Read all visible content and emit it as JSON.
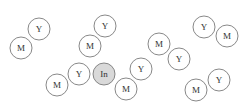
{
  "diagram": {
    "radius": 11,
    "colors": {
      "stroke": "#7a7a7a",
      "fill": "#ffffff",
      "center_fill": "#d9d9d9",
      "text": "#333333"
    },
    "nodes": [
      {
        "label": "Y",
        "x": 39,
        "y": 29,
        "type": "normal"
      },
      {
        "label": "M",
        "x": 21,
        "y": 48,
        "type": "normal"
      },
      {
        "label": "Y",
        "x": 105,
        "y": 26,
        "type": "normal"
      },
      {
        "label": "M",
        "x": 90,
        "y": 46,
        "type": "normal"
      },
      {
        "label": "M",
        "x": 57,
        "y": 85,
        "type": "normal"
      },
      {
        "label": "Y",
        "x": 79,
        "y": 74,
        "type": "normal"
      },
      {
        "label": "In",
        "x": 104,
        "y": 74,
        "type": "center"
      },
      {
        "label": "M",
        "x": 126,
        "y": 89,
        "type": "normal"
      },
      {
        "label": "Y",
        "x": 141,
        "y": 69,
        "type": "normal"
      },
      {
        "label": "M",
        "x": 159,
        "y": 44,
        "type": "normal"
      },
      {
        "label": "Y",
        "x": 179,
        "y": 59,
        "type": "normal"
      },
      {
        "label": "Y",
        "x": 204,
        "y": 27,
        "type": "normal"
      },
      {
        "label": "M",
        "x": 227,
        "y": 36,
        "type": "normal"
      },
      {
        "label": "M",
        "x": 196,
        "y": 90,
        "type": "normal"
      },
      {
        "label": "Y",
        "x": 219,
        "y": 80,
        "type": "normal"
      }
    ]
  }
}
